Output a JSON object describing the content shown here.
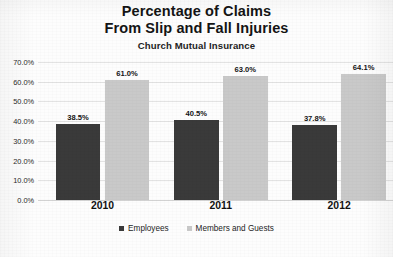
{
  "chart_data": {
    "type": "bar",
    "title": "Percentage of Claims From Slip and Fall Injuries",
    "title_lines": [
      "Percentage of Claims",
      "From Slip and Fall Injuries"
    ],
    "subtitle": "Church Mutual Insurance",
    "xlabel": "",
    "ylabel": "",
    "ylim": [
      0,
      70
    ],
    "grid": true,
    "legend_position": "bottom",
    "categories": [
      "2010",
      "2011",
      "2012"
    ],
    "ytick_labels": [
      "0.0%",
      "10.0%",
      "20.0%",
      "30.0%",
      "40.0%",
      "50.0%",
      "60.0%",
      "70.0%"
    ],
    "ytick_values": [
      0,
      10,
      20,
      30,
      40,
      50,
      60,
      70
    ],
    "series": [
      {
        "name": "Employees",
        "color": "#3a3a3a",
        "values": [
          38.5,
          40.5,
          37.8
        ],
        "labels": [
          "38.5%",
          "40.5%",
          "37.8%"
        ]
      },
      {
        "name": "Members and Guests",
        "color": "#c9c9c9",
        "values": [
          61.0,
          63.0,
          64.1
        ],
        "labels": [
          "61.0%",
          "63.0%",
          "64.1%"
        ]
      }
    ]
  },
  "footer": {
    "cut_text": ""
  }
}
